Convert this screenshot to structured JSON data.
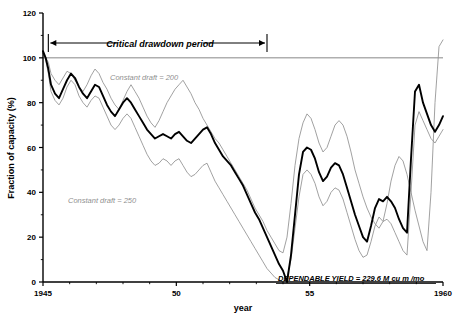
{
  "figure": {
    "background": "#ffffff",
    "width": 462,
    "height": 325
  },
  "axes": {
    "y_title": "Fraction of capacity (%)",
    "x_title": "year",
    "y_ticks": [
      "0",
      "20",
      "40",
      "60",
      "80",
      "100",
      "120"
    ],
    "x_ticks": [
      "1945",
      "50",
      "55",
      "1960"
    ],
    "y_minor_step": 10,
    "x_minor_step": 1
  },
  "annotations": {
    "critical_period": "Critical  drawdown  period",
    "constant_draft_200": "Constant draft = 200",
    "constant_draft_250": "Constant draft =  250",
    "dependable_yield": "DEPENDABLE YIELD =  229.6 M cu m /mo"
  },
  "colors": {
    "main_curve": "#000000",
    "secondary_curve": "#909090",
    "reference_line": "#7a7a7a",
    "axis": "#000000",
    "gray_text": "#8f8f8f"
  },
  "chart_data": {
    "type": "line",
    "title": "",
    "subtitle": "",
    "xlabel": "year",
    "ylabel": "Fraction of capacity (%)",
    "xlim": [
      1945,
      1960
    ],
    "ylim": [
      0,
      120
    ],
    "grid": false,
    "legend": "inline-annotations",
    "reference_lines": [
      {
        "name": "full-capacity",
        "y": 100,
        "color": "#7a7a7a"
      }
    ],
    "critical_drawdown_period": {
      "start": 1945.2,
      "end": 1953.4
    },
    "series": [
      {
        "name": "Constant draft = 200",
        "color": "#909090",
        "x": [
          1945.0,
          1945.1,
          1945.2,
          1945.3,
          1945.45,
          1945.6,
          1945.75,
          1945.9,
          1946.05,
          1946.2,
          1946.35,
          1946.5,
          1946.65,
          1946.8,
          1946.95,
          1947.1,
          1947.25,
          1947.4,
          1947.55,
          1947.7,
          1947.85,
          1948.0,
          1948.15,
          1948.3,
          1948.45,
          1948.6,
          1948.75,
          1948.9,
          1949.05,
          1949.2,
          1949.35,
          1949.5,
          1949.65,
          1949.8,
          1949.95,
          1950.1,
          1950.25,
          1950.4,
          1950.55,
          1950.7,
          1950.85,
          1951.0,
          1951.15,
          1951.3,
          1951.45,
          1951.6,
          1951.75,
          1951.9,
          1952.05,
          1952.2,
          1952.35,
          1952.5,
          1952.65,
          1952.8,
          1952.95,
          1953.1,
          1953.25,
          1953.4,
          1953.55,
          1953.7,
          1953.85,
          1954.0,
          1954.15,
          1954.3,
          1954.45,
          1954.6,
          1954.75,
          1954.9,
          1955.05,
          1955.2,
          1955.35,
          1955.5,
          1955.65,
          1955.8,
          1955.95,
          1956.1,
          1956.25,
          1956.4,
          1956.55,
          1956.7,
          1956.85,
          1957.0,
          1957.15,
          1957.3,
          1957.45,
          1957.6,
          1957.75,
          1957.9,
          1958.05,
          1958.2,
          1958.35,
          1958.5,
          1958.65,
          1958.8,
          1958.95,
          1959.1,
          1959.25,
          1959.4,
          1959.55,
          1959.7,
          1959.85,
          1960.0
        ],
        "y": [
          102,
          100,
          98,
          93,
          90,
          88,
          91,
          94,
          93,
          90,
          87,
          85,
          88,
          92,
          95,
          93,
          89,
          86,
          82,
          79,
          77,
          81,
          85,
          88,
          85,
          82,
          78,
          74,
          71,
          69,
          72,
          76,
          80,
          83,
          86,
          88,
          90,
          87,
          84,
          80,
          77,
          73,
          70,
          67,
          64,
          62,
          59,
          56,
          53,
          50,
          47,
          44,
          41,
          37,
          33,
          30,
          27,
          23,
          20,
          17,
          14,
          13,
          20,
          35,
          52,
          64,
          71,
          75,
          73,
          68,
          62,
          58,
          60,
          65,
          70,
          72,
          70,
          65,
          58,
          50,
          44,
          38,
          33,
          29,
          26,
          24,
          27,
          35,
          45,
          52,
          56,
          54,
          48,
          40,
          32,
          25,
          18,
          14,
          40,
          80,
          105,
          108
        ]
      },
      {
        "name": "Main operating trace",
        "color": "#000000",
        "x": [
          1945.0,
          1945.1,
          1945.2,
          1945.3,
          1945.45,
          1945.6,
          1945.75,
          1945.9,
          1946.05,
          1946.2,
          1946.35,
          1946.5,
          1946.65,
          1946.8,
          1946.95,
          1947.1,
          1947.25,
          1947.4,
          1947.55,
          1947.7,
          1947.85,
          1948.0,
          1948.15,
          1948.3,
          1948.45,
          1948.6,
          1948.75,
          1948.9,
          1949.05,
          1949.2,
          1949.35,
          1949.5,
          1949.65,
          1949.8,
          1949.95,
          1950.1,
          1950.25,
          1950.4,
          1950.55,
          1950.7,
          1950.85,
          1951.0,
          1951.15,
          1951.3,
          1951.45,
          1951.6,
          1951.75,
          1951.9,
          1952.05,
          1952.2,
          1952.35,
          1952.5,
          1952.65,
          1952.8,
          1952.95,
          1953.1,
          1953.25,
          1953.4,
          1953.55,
          1953.7,
          1953.85,
          1954.0,
          1954.15,
          1954.3,
          1954.45,
          1954.6,
          1954.75,
          1954.9,
          1955.05,
          1955.2,
          1955.35,
          1955.5,
          1955.65,
          1955.8,
          1955.95,
          1956.1,
          1956.25,
          1956.4,
          1956.55,
          1956.7,
          1956.85,
          1957.0,
          1957.15,
          1957.3,
          1957.45,
          1957.6,
          1957.75,
          1957.9,
          1958.05,
          1958.2,
          1958.35,
          1958.5,
          1958.65,
          1958.8,
          1958.95,
          1959.1,
          1959.25,
          1959.4,
          1959.55,
          1959.7,
          1959.85,
          1960.0
        ],
        "y": [
          103,
          100,
          95,
          88,
          84,
          82,
          86,
          90,
          93,
          91,
          87,
          84,
          82,
          85,
          88,
          87,
          83,
          79,
          76,
          74,
          77,
          80,
          82,
          80,
          77,
          74,
          71,
          68,
          66,
          64,
          65,
          66,
          65,
          64,
          66,
          67,
          65,
          63,
          62,
          64,
          66,
          68,
          69,
          66,
          62,
          59,
          56,
          54,
          52,
          49,
          46,
          43,
          39,
          35,
          31,
          28,
          24,
          20,
          16,
          12,
          8,
          5,
          0,
          12,
          30,
          48,
          58,
          60,
          59,
          55,
          49,
          45,
          47,
          51,
          53,
          52,
          48,
          42,
          36,
          30,
          25,
          20,
          18,
          25,
          33,
          37,
          36,
          38,
          36,
          33,
          28,
          24,
          22,
          55,
          85,
          88,
          80,
          75,
          70,
          67,
          70,
          74
        ]
      },
      {
        "name": "Constant draft = 250",
        "color": "#909090",
        "x": [
          1945.0,
          1945.1,
          1945.2,
          1945.3,
          1945.45,
          1945.6,
          1945.75,
          1945.9,
          1946.05,
          1946.2,
          1946.35,
          1946.5,
          1946.65,
          1946.8,
          1946.95,
          1947.1,
          1947.25,
          1947.4,
          1947.55,
          1947.7,
          1947.85,
          1948.0,
          1948.15,
          1948.3,
          1948.45,
          1948.6,
          1948.75,
          1948.9,
          1949.05,
          1949.2,
          1949.35,
          1949.5,
          1949.65,
          1949.8,
          1949.95,
          1950.1,
          1950.25,
          1950.4,
          1950.55,
          1950.7,
          1950.85,
          1951.0,
          1951.15,
          1951.3,
          1951.45,
          1951.6,
          1951.75,
          1951.9,
          1952.05,
          1952.2,
          1952.35,
          1952.5,
          1952.65,
          1952.8,
          1952.95,
          1953.1,
          1953.25,
          1953.4,
          1953.55,
          1953.7,
          1953.85,
          1954.0,
          1954.15,
          1954.3,
          1954.45,
          1954.6,
          1954.75,
          1954.9,
          1955.05,
          1955.2,
          1955.35,
          1955.5,
          1955.65,
          1955.8,
          1955.95,
          1956.1,
          1956.25,
          1956.4,
          1956.55,
          1956.7,
          1956.85,
          1957.0,
          1957.15,
          1957.3,
          1957.45,
          1957.6,
          1957.75,
          1957.9,
          1958.05,
          1958.2,
          1958.35,
          1958.5,
          1958.65,
          1958.8,
          1958.95,
          1959.1,
          1959.25,
          1959.4,
          1959.55,
          1959.7,
          1959.85,
          1960.0
        ],
        "y": [
          102,
          99,
          93,
          85,
          81,
          79,
          82,
          87,
          90,
          88,
          83,
          80,
          78,
          81,
          83,
          82,
          78,
          74,
          70,
          68,
          70,
          73,
          75,
          73,
          69,
          65,
          61,
          57,
          54,
          52,
          53,
          55,
          54,
          52,
          54,
          55,
          52,
          49,
          47,
          48,
          50,
          52,
          53,
          49,
          45,
          42,
          39,
          36,
          33,
          30,
          27,
          24,
          21,
          18,
          15,
          12,
          9,
          6,
          4,
          2,
          1,
          0,
          2,
          10,
          24,
          38,
          48,
          50,
          48,
          44,
          38,
          34,
          36,
          40,
          42,
          41,
          37,
          31,
          25,
          19,
          14,
          11,
          12,
          18,
          25,
          29,
          27,
          28,
          26,
          22,
          18,
          14,
          12,
          40,
          70,
          76,
          72,
          68,
          64,
          62,
          65,
          68
        ]
      }
    ]
  },
  "caption_fragment": ""
}
